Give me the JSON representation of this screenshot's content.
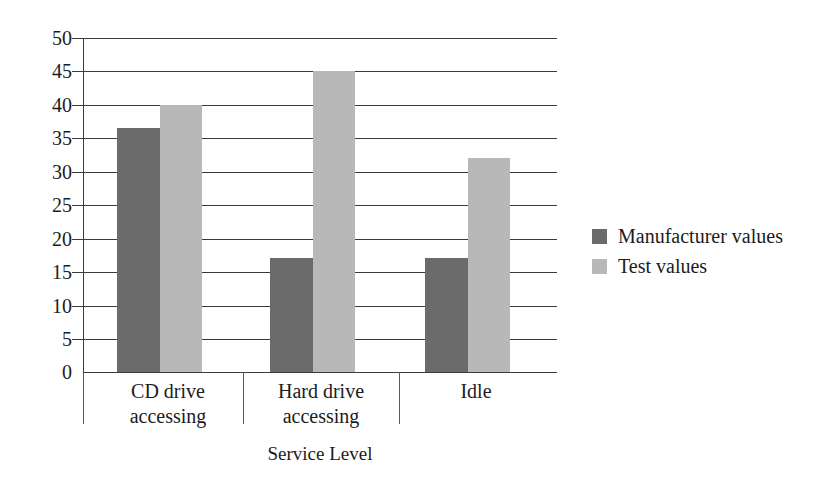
{
  "chart_data": {
    "type": "bar",
    "title": "",
    "xlabel": "Service Level",
    "ylabel": "",
    "categories": [
      "CD drive accessing",
      "Hard drive accessing",
      "Idle"
    ],
    "series": [
      {
        "name": "Manufacturer values",
        "color": "#6b6b6b",
        "values": [
          36.5,
          17,
          17
        ]
      },
      {
        "name": "Test values",
        "color": "#b8b8b8",
        "values": [
          40,
          45,
          32
        ]
      }
    ],
    "ylim": [
      0,
      50
    ],
    "ytick_labels": [
      "50",
      "45",
      "40",
      "35",
      "30",
      "25",
      "20",
      "15",
      "10",
      "5",
      "0"
    ],
    "ytick_values": [
      50,
      45,
      40,
      35,
      30,
      25,
      20,
      15,
      10,
      5,
      0
    ],
    "grid": true,
    "legend_position": "right"
  },
  "axis": {
    "x_title": "Service Level"
  },
  "legend": {
    "items": [
      {
        "label": "Manufacturer values",
        "color": "#6b6b6b"
      },
      {
        "label": "Test values",
        "color": "#b8b8b8"
      }
    ]
  },
  "colors": {
    "manufacturer": "#6b6b6b",
    "test": "#b8b8b8",
    "axis": "#3a3a3a",
    "text": "#1c1c1c",
    "background": "#ffffff"
  }
}
